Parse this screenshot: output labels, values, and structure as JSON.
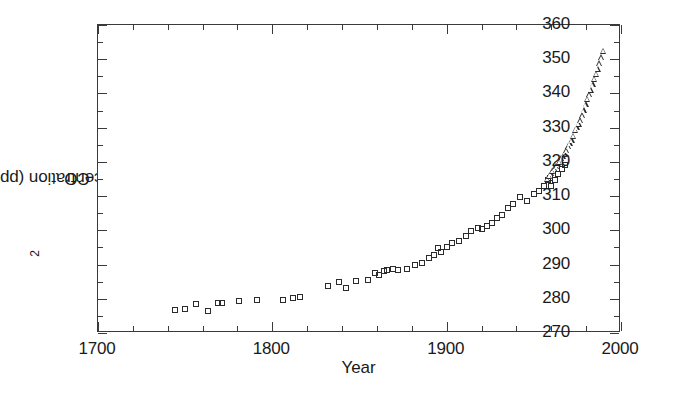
{
  "chart_data": {
    "type": "scatter",
    "title": "",
    "xlabel": "Year",
    "ylabel": "CO2 concentration (ppmv)",
    "ylabel_parts": {
      "prefix": "CO",
      "sub": "2",
      "suffix": " concentration (ppmv)"
    },
    "xlim": [
      1700,
      2000
    ],
    "ylim": [
      270,
      360
    ],
    "xticks": [
      1700,
      1800,
      1900,
      2000
    ],
    "xticklabels": [
      "1700",
      "1800",
      "1900",
      "2000"
    ],
    "xtick_minor_step": 20,
    "yticks": [
      270,
      280,
      290,
      300,
      310,
      320,
      330,
      340,
      350,
      360
    ],
    "yticklabels": [
      "270",
      "280",
      "290",
      "300",
      "310",
      "320",
      "330",
      "340",
      "350",
      "360"
    ],
    "ytick_minor_step": 5,
    "grid": false,
    "legend": "none",
    "marker_color": "#2b2b2b",
    "axis_color": "#3a3a3a",
    "background": "#ffffff",
    "series": [
      {
        "name": "Ice core record",
        "marker": "open-square",
        "points": [
          [
            1744,
            276.6
          ],
          [
            1750,
            277.0
          ],
          [
            1756,
            278.6
          ],
          [
            1763,
            276.5
          ],
          [
            1769,
            278.8
          ],
          [
            1771,
            278.9
          ],
          [
            1781,
            279.4
          ],
          [
            1791,
            279.6
          ],
          [
            1806,
            279.7
          ],
          [
            1812,
            280.2
          ],
          [
            1816,
            280.4
          ],
          [
            1832,
            283.6
          ],
          [
            1838,
            284.8
          ],
          [
            1842,
            283.2
          ],
          [
            1848,
            285.2
          ],
          [
            1855,
            285.5
          ],
          [
            1859,
            287.4
          ],
          [
            1861,
            287.0
          ],
          [
            1864,
            288.0
          ],
          [
            1866,
            288.3
          ],
          [
            1869,
            288.6
          ],
          [
            1872,
            288.4
          ],
          [
            1877,
            288.6
          ],
          [
            1882,
            290.0
          ],
          [
            1886,
            290.4
          ],
          [
            1890,
            292.0
          ],
          [
            1893,
            292.9
          ],
          [
            1895,
            294.7
          ],
          [
            1897,
            293.8
          ],
          [
            1900,
            295.0
          ],
          [
            1903,
            296.2
          ],
          [
            1907,
            297.0
          ],
          [
            1911,
            298.4
          ],
          [
            1914,
            299.8
          ],
          [
            1918,
            300.6
          ],
          [
            1920,
            300.4
          ],
          [
            1923,
            301.2
          ],
          [
            1926,
            302.0
          ],
          [
            1929,
            303.5
          ],
          [
            1932,
            304.6
          ],
          [
            1935,
            306.4
          ],
          [
            1938,
            307.8
          ],
          [
            1942,
            309.8
          ],
          [
            1946,
            308.6
          ],
          [
            1950,
            310.6
          ],
          [
            1953,
            311.4
          ],
          [
            1956,
            313.0
          ],
          [
            1958,
            314.8
          ],
          [
            1959,
            315.2
          ],
          [
            1960,
            313.0
          ],
          [
            1962,
            314.6
          ],
          [
            1964,
            316.4
          ],
          [
            1966,
            318.0
          ],
          [
            1968,
            319.2
          ]
        ]
      },
      {
        "name": "Mauna Loa record",
        "marker": "open-triangle",
        "points": [
          [
            1958,
            315.0
          ],
          [
            1959,
            315.8
          ],
          [
            1960,
            316.6
          ],
          [
            1961,
            317.3
          ],
          [
            1962,
            318.0
          ],
          [
            1963,
            318.6
          ],
          [
            1964,
            319.2
          ],
          [
            1965,
            319.9
          ],
          [
            1966,
            320.9
          ],
          [
            1967,
            321.6
          ],
          [
            1968,
            322.3
          ],
          [
            1969,
            323.3
          ],
          [
            1970,
            324.5
          ],
          [
            1971,
            325.3
          ],
          [
            1972,
            326.2
          ],
          [
            1973,
            327.5
          ],
          [
            1974,
            329.3
          ],
          [
            1975,
            330.1
          ],
          [
            1976,
            331.0
          ],
          [
            1977,
            332.0
          ],
          [
            1978,
            333.5
          ],
          [
            1979,
            335.0
          ],
          [
            1980,
            336.7
          ],
          [
            1981,
            338.4
          ],
          [
            1982,
            339.6
          ],
          [
            1983,
            341.0
          ],
          [
            1984,
            342.6
          ],
          [
            1985,
            344.2
          ],
          [
            1986,
            345.7
          ],
          [
            1987,
            347.1
          ],
          [
            1988,
            348.8
          ],
          [
            1989,
            350.4
          ],
          [
            1990,
            352.4
          ]
        ]
      }
    ]
  }
}
